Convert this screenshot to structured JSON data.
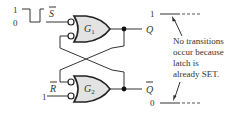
{
  "diagram": {
    "type": "S-R latch (active-LOW input NAND equivalent)",
    "inputs": {
      "s_bar": {
        "label": "S",
        "overbar": true,
        "waveform_levels": [
          "1",
          "0"
        ],
        "waveform": "pulse-low"
      },
      "r_bar": {
        "label": "R",
        "overbar": true,
        "level": "1"
      }
    },
    "gates": [
      {
        "id": "g1",
        "label": "G",
        "subscript": "1"
      },
      {
        "id": "g2",
        "label": "G",
        "subscript": "2"
      }
    ],
    "outputs": {
      "q": {
        "label": "Q",
        "overbar": false,
        "level": "1"
      },
      "q_bar": {
        "label": "Q",
        "overbar": true,
        "level": "0"
      }
    },
    "annotation": {
      "lines": [
        "No transitions",
        "occur because",
        "latch is",
        "already SET."
      ]
    },
    "colors": {
      "line": "#333333",
      "gate_fill": "#e3e3e3",
      "background": "#ffffff"
    }
  }
}
